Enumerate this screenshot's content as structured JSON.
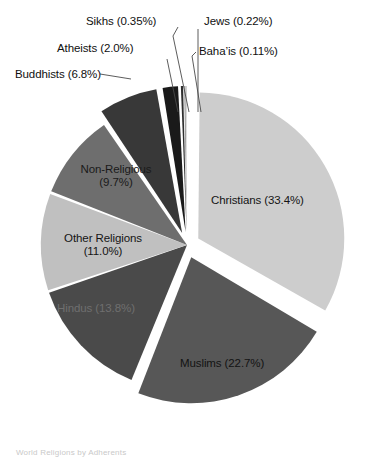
{
  "figure": {
    "background_color": "#ffffff",
    "width": 380,
    "height": 454,
    "caption": "World Religions by Adherents",
    "text_color": "#101010"
  },
  "chart_data": {
    "type": "pie",
    "title": "",
    "xlabel": "",
    "ylabel": "",
    "legend_position": "none",
    "grid": false,
    "start_angle_deg": 0,
    "direction": "clockwise",
    "total_percent": 100.0,
    "categories": [
      "Christians",
      "Muslims",
      "Hindus",
      "Other Religions",
      "Non-Religious",
      "Buddhists",
      "Atheists",
      "Sikhs",
      "Jews",
      "Baha'is"
    ],
    "values": [
      33.4,
      22.7,
      13.8,
      11.0,
      9.7,
      6.8,
      2.0,
      0.35,
      0.22,
      0.11
    ],
    "colors": [
      "#cdcdcd",
      "#575757",
      "#4a4a4a",
      "#c0c0c0",
      "#6e6e6e",
      "#383838",
      "#1a1a1a",
      "#2e2e2e",
      "#9a9a9a",
      "#bdbdbd"
    ],
    "slices": [
      {
        "name": "Christians",
        "value": 33.4,
        "label": "Christians (33.4%)",
        "color": "#cdcdcd",
        "exploded": true,
        "label_placement": "inside"
      },
      {
        "name": "Muslims",
        "value": 22.7,
        "label": "Muslims (22.7%)",
        "color": "#575757",
        "exploded": true,
        "label_placement": "inside"
      },
      {
        "name": "Hindus",
        "value": 13.8,
        "label": "Hindus (13.8%)",
        "color": "#4a4a4a",
        "exploded": false,
        "label_placement": "inside"
      },
      {
        "name": "Other Religions",
        "value": 11.0,
        "label_line1": "Other Religions",
        "label_line2": "(11.0%)",
        "color": "#c0c0c0",
        "exploded": false,
        "label_placement": "inside"
      },
      {
        "name": "Non-Religious",
        "value": 9.7,
        "label_line1": "Non-Religious",
        "label_line2": "(9.7%)",
        "color": "#6e6e6e",
        "exploded": false,
        "label_placement": "inside"
      },
      {
        "name": "Buddhists",
        "value": 6.8,
        "label": "Buddhists (6.8%)",
        "color": "#383838",
        "exploded": true,
        "label_placement": "callout"
      },
      {
        "name": "Atheists",
        "value": 2.0,
        "label": "Atheists (2.0%)",
        "color": "#1a1a1a",
        "exploded": true,
        "label_placement": "callout"
      },
      {
        "name": "Sikhs",
        "value": 0.35,
        "label": "Sikhs (0.35%)",
        "color": "#2e2e2e",
        "exploded": true,
        "label_placement": "callout"
      },
      {
        "name": "Jews",
        "value": 0.22,
        "label": "Jews (0.22%)",
        "color": "#9a9a9a",
        "exploded": true,
        "label_placement": "callout"
      },
      {
        "name": "Baha'is",
        "value": 0.11,
        "label": "Baha’is (0.11%)",
        "color": "#bdbdbd",
        "exploded": true,
        "label_placement": "callout"
      }
    ]
  }
}
